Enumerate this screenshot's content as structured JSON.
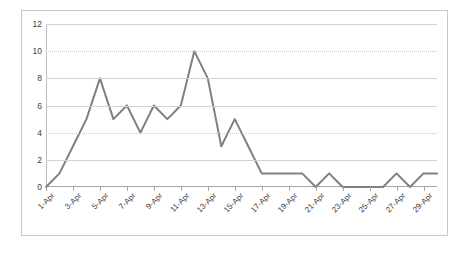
{
  "chart_data": {
    "type": "line",
    "title": "",
    "subtitle": "",
    "xlabel": "",
    "ylabel": "",
    "grid": true,
    "legend": false,
    "legend_position": "none",
    "series_color": "#808080",
    "gridline_color": "#d2d2d2",
    "axis_color": "#a6a6a6",
    "frame_color": "#c8c8c8",
    "background": "#ffffff",
    "ylim": [
      0,
      12
    ],
    "ytick_values": [
      0,
      2,
      4,
      6,
      8,
      10,
      12
    ],
    "ytick_labels": [
      "0",
      "2",
      "4",
      "6",
      "8",
      "10",
      "12"
    ],
    "xlim": [
      1,
      30
    ],
    "xtick_labels": [
      "1-Apr",
      "3-Apr",
      "5-Apr",
      "7-Apr",
      "9-Apr",
      "11-Apr",
      "13-Apr",
      "15-Apr",
      "17-Apr",
      "19-Apr",
      "21-Apr",
      "23-Apr",
      "25-Apr",
      "27-Apr",
      "29-Apr"
    ],
    "xtick_days": [
      1,
      3,
      5,
      7,
      9,
      11,
      13,
      15,
      17,
      19,
      21,
      23,
      25,
      27,
      29
    ],
    "x": [
      1,
      2,
      3,
      4,
      5,
      6,
      7,
      8,
      9,
      10,
      11,
      12,
      13,
      14,
      15,
      16,
      17,
      18,
      19,
      20,
      21,
      22,
      23,
      24,
      25,
      26,
      27,
      28,
      29,
      30
    ],
    "categories": [
      "1-Apr",
      "2-Apr",
      "3-Apr",
      "4-Apr",
      "5-Apr",
      "6-Apr",
      "7-Apr",
      "8-Apr",
      "9-Apr",
      "10-Apr",
      "11-Apr",
      "12-Apr",
      "13-Apr",
      "14-Apr",
      "15-Apr",
      "16-Apr",
      "17-Apr",
      "18-Apr",
      "19-Apr",
      "20-Apr",
      "21-Apr",
      "22-Apr",
      "23-Apr",
      "24-Apr",
      "25-Apr",
      "26-Apr",
      "27-Apr",
      "28-Apr",
      "29-Apr",
      "30-Apr"
    ],
    "values": [
      0,
      1,
      3,
      5,
      8,
      5,
      6,
      4,
      6,
      5,
      6,
      10,
      8,
      3,
      5,
      3,
      1,
      1,
      1,
      1,
      0,
      1,
      0,
      0,
      0,
      0,
      1,
      0,
      1,
      1
    ],
    "series": [
      {
        "name": "series-1",
        "values": [
          0,
          1,
          3,
          5,
          8,
          5,
          6,
          4,
          6,
          5,
          6,
          10,
          8,
          3,
          5,
          3,
          1,
          1,
          1,
          1,
          0,
          1,
          0,
          0,
          0,
          0,
          1,
          0,
          1,
          1
        ]
      }
    ],
    "peak_value": 10,
    "peak_category": "12-Apr",
    "min_value": 0
  }
}
